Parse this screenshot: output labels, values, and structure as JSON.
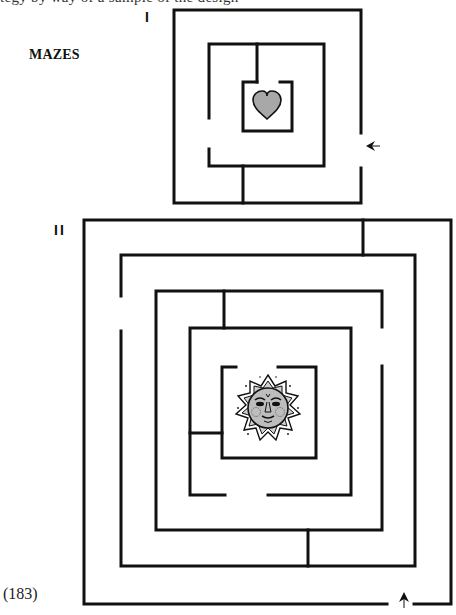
{
  "page": {
    "cut_off_text": "tegy by way of a sample of the design",
    "heading": "MAZES",
    "page_number": "(183)"
  },
  "mazes": [
    {
      "label": "I",
      "goal": "heart",
      "goal_color": "#a8a8a8",
      "entrance_arrow": "arrow-left",
      "entrance_side": "right"
    },
    {
      "label": "II",
      "goal": "sun-face",
      "goal_color": "#bdbdbd",
      "entrance_arrow": "arrow-up",
      "entrance_side": "bottom"
    }
  ],
  "colors": {
    "wall": "#111111",
    "background": "#ffffff"
  }
}
